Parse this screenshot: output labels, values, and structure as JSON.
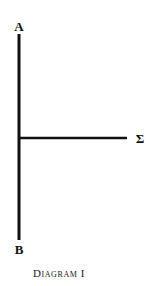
{
  "diagram": {
    "labels": {
      "top": "A",
      "bottom": "B",
      "right": "Σ"
    },
    "caption": "Diagram I",
    "line_color": "#111111"
  }
}
